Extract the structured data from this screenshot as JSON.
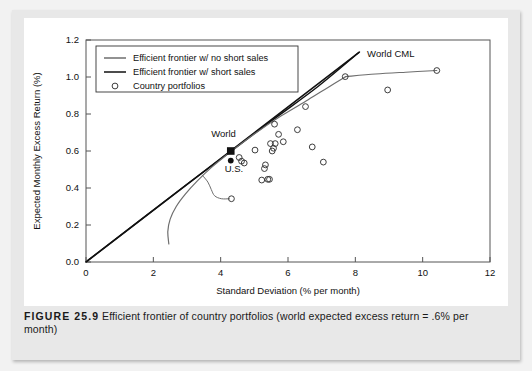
{
  "caption": {
    "figure_label": "FIGURE 25.9",
    "text": "Efficient frontier of country portfolios (world expected excess return = .6% per month)"
  },
  "chart_data": {
    "type": "scatter",
    "title": "",
    "xlabel": "Standard Deviation (% per month)",
    "ylabel": "Expected Monthly Excess Return (%)",
    "xlim": [
      0,
      12
    ],
    "ylim": [
      0.0,
      1.2
    ],
    "xticks": [
      0,
      2,
      4,
      6,
      8,
      10,
      12
    ],
    "yticks": [
      "0.0",
      "0.2",
      "0.4",
      "0.6",
      "0.8",
      "1.0",
      "1.2"
    ],
    "grid": false,
    "legend_position": "top-left",
    "legend": [
      {
        "label": "Efficient frontier w/ no short sales",
        "marker": "line",
        "color": "#6e6e6e"
      },
      {
        "label": "Efficient frontier w/ short sales",
        "marker": "line",
        "color": "#111111"
      },
      {
        "label": "Country portfolios",
        "marker": "circle-open",
        "color": "#333333"
      }
    ],
    "annotations": [
      {
        "name": "world-cml-label",
        "text": "World CML",
        "x": 8.35,
        "y": 1.11
      },
      {
        "name": "world-label",
        "text": "World",
        "x": 3.72,
        "y": 0.675
      },
      {
        "name": "us-label",
        "text": "U.S.",
        "x": 4.12,
        "y": 0.487
      }
    ],
    "series": [
      {
        "name": "Country portfolios",
        "marker": "circle-open",
        "points": [
          [
            4.55,
            0.565
          ],
          [
            4.62,
            0.545
          ],
          [
            4.7,
            0.535
          ],
          [
            5.02,
            0.605
          ],
          [
            5.22,
            0.443
          ],
          [
            5.3,
            0.505
          ],
          [
            5.33,
            0.525
          ],
          [
            5.4,
            0.447
          ],
          [
            5.45,
            0.447
          ],
          [
            5.48,
            0.64
          ],
          [
            5.53,
            0.6
          ],
          [
            5.57,
            0.615
          ],
          [
            5.6,
            0.745
          ],
          [
            5.62,
            0.64
          ],
          [
            5.72,
            0.69
          ],
          [
            5.86,
            0.65
          ],
          [
            6.28,
            0.715
          ],
          [
            6.52,
            0.84
          ],
          [
            6.72,
            0.622
          ],
          [
            7.05,
            0.54
          ],
          [
            7.7,
            1.002
          ],
          [
            8.96,
            0.93
          ],
          [
            10.42,
            1.035
          ],
          [
            4.32,
            0.342
          ]
        ]
      },
      {
        "name": "World",
        "marker": "square-filled",
        "points": [
          [
            4.3,
            0.6
          ]
        ]
      },
      {
        "name": "U.S.",
        "marker": "circle-filled",
        "points": [
          [
            4.3,
            0.548
          ]
        ]
      }
    ],
    "lines": [
      {
        "name": "World CML",
        "style": "straight",
        "color": "#111111",
        "width": 1.6,
        "points": [
          [
            0.0,
            0.0
          ],
          [
            8.12,
            1.135
          ]
        ]
      },
      {
        "name": "Efficient frontier w/ short sales",
        "style": "curve",
        "color": "#111111",
        "width": 1.4,
        "points": [
          [
            0.05,
            0.008
          ],
          [
            1.6,
            0.225
          ],
          [
            3.0,
            0.42
          ],
          [
            4.3,
            0.598
          ],
          [
            5.6,
            0.775
          ],
          [
            6.9,
            0.95
          ],
          [
            8.1,
            1.132
          ]
        ]
      },
      {
        "name": "Efficient frontier w/ no short sales",
        "style": "curve",
        "color": "#6e6e6e",
        "width": 1.2,
        "points": [
          [
            2.46,
            0.098
          ],
          [
            2.43,
            0.165
          ],
          [
            2.5,
            0.232
          ],
          [
            2.68,
            0.3
          ],
          [
            2.95,
            0.367
          ],
          [
            3.3,
            0.437
          ],
          [
            3.72,
            0.51
          ],
          [
            4.3,
            0.596
          ],
          [
            5.0,
            0.692
          ],
          [
            5.8,
            0.79
          ],
          [
            6.6,
            0.877
          ],
          [
            7.2,
            0.945
          ],
          [
            7.7,
            1.0
          ]
        ]
      },
      {
        "name": "no-short-sales-upper-tail",
        "style": "curve",
        "color": "#6e6e6e",
        "width": 1.1,
        "points": [
          [
            7.7,
            1.002
          ],
          [
            8.6,
            1.016
          ],
          [
            9.5,
            1.026
          ],
          [
            10.42,
            1.035
          ]
        ]
      },
      {
        "name": "outlier-connector",
        "style": "curve",
        "color": "#6e6e6e",
        "width": 1.0,
        "points": [
          [
            3.45,
            0.47
          ],
          [
            3.62,
            0.432
          ],
          [
            3.72,
            0.392
          ],
          [
            3.82,
            0.358
          ],
          [
            4.02,
            0.342
          ],
          [
            4.26,
            0.342
          ]
        ]
      }
    ]
  }
}
